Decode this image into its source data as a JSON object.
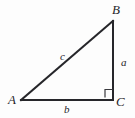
{
  "figure": {
    "type": "right-triangle-diagram",
    "background_color": "#fdfdfd",
    "stroke_color": "#26262a",
    "stroke_width": 2,
    "width": 135,
    "height": 118
  },
  "vertices": [
    {
      "id": "A",
      "label": "A",
      "x": 21,
      "y": 100,
      "position": "bottom-left"
    },
    {
      "id": "B",
      "label": "B",
      "x": 113,
      "y": 21,
      "position": "top-right"
    },
    {
      "id": "C",
      "label": "C",
      "x": 113,
      "y": 100,
      "position": "bottom-right"
    }
  ],
  "sides": [
    {
      "id": "c",
      "label": "c",
      "from": "A",
      "to": "B",
      "role": "hypotenuse",
      "label_x": 63,
      "label_y": 56
    },
    {
      "id": "a",
      "label": "a",
      "from": "B",
      "to": "C",
      "role": "vertical-leg",
      "label_x": 125,
      "label_y": 62
    },
    {
      "id": "b",
      "label": "b",
      "from": "A",
      "to": "C",
      "role": "base-leg",
      "label_x": 67,
      "label_y": 109
    }
  ],
  "right_angle": {
    "at_vertex": "C",
    "marker": "square",
    "size": 8,
    "x": 105,
    "y": 89
  }
}
